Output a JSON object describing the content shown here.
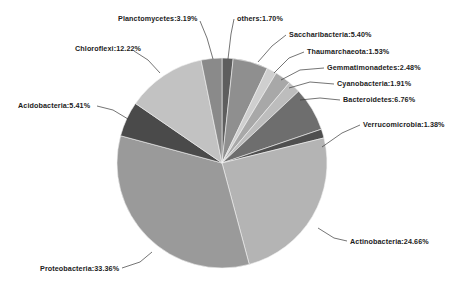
{
  "chart_data": {
    "type": "pie",
    "title": "",
    "subtitle": "",
    "xlabel": "",
    "ylabel": "",
    "legend_position": "none",
    "grid": false,
    "value_unit": "%",
    "start_angle_deg": 0,
    "direction": "clockwise",
    "categories": [
      "others",
      "Saccharibacteria",
      "Thaumarchaeota",
      "Gemmatimonadetes",
      "Cyanobacteria",
      "Bacteroidetes",
      "Verrucomicrobia",
      "Actinobacteria",
      "Proteobacteria",
      "Acidobacteria",
      "Chloroflexi",
      "Planctomycetes"
    ],
    "values": [
      1.7,
      5.4,
      1.53,
      2.48,
      1.91,
      6.76,
      1.38,
      24.66,
      33.36,
      5.41,
      12.22,
      3.19
    ],
    "colors": [
      "#5e5e5e",
      "#8f8f8f",
      "#cfcfcf",
      "#a8a8a8",
      "#bdbdbd",
      "#6e6e6e",
      "#4f4f4f",
      "#b4b4b4",
      "#9a9a9a",
      "#4a4a4a",
      "#c2c2c2",
      "#8a8a8a"
    ],
    "slices": [
      {
        "label": "others:1.70%",
        "name": "others",
        "value": 1.7,
        "color": "#5e5e5e"
      },
      {
        "label": "Saccharibacteria:5.40%",
        "name": "Saccharibacteria",
        "value": 5.4,
        "color": "#8f8f8f"
      },
      {
        "label": "Thaumarchaeota:1.53%",
        "name": "Thaumarchaeota",
        "value": 1.53,
        "color": "#cfcfcf"
      },
      {
        "label": "Gemmatimonadetes:2.48%",
        "name": "Gemmatimonadetes",
        "value": 2.48,
        "color": "#a8a8a8"
      },
      {
        "label": "Cyanobacteria:1.91%",
        "name": "Cyanobacteria",
        "value": 1.91,
        "color": "#bdbdbd"
      },
      {
        "label": "Bacteroidetes:6.76%",
        "name": "Bacteroidetes",
        "value": 6.76,
        "color": "#6e6e6e"
      },
      {
        "label": "Verrucomicrobia:1.38%",
        "name": "Verrucomicrobia",
        "value": 1.38,
        "color": "#4f4f4f"
      },
      {
        "label": "Actinobacteria:24.66%",
        "name": "Actinobacteria",
        "value": 24.66,
        "color": "#b4b4b4"
      },
      {
        "label": "Proteobacteria:33.36%",
        "name": "Proteobacteria",
        "value": 33.36,
        "color": "#9a9a9a"
      },
      {
        "label": "Acidobacteria:5.41%",
        "name": "Acidobacteria",
        "value": 5.41,
        "color": "#4a4a4a"
      },
      {
        "label": "Chloroflexi:12.22%",
        "name": "Chloroflexi",
        "value": 12.22,
        "color": "#c2c2c2"
      },
      {
        "label": "Planctomycetes:3.19%",
        "name": "Planctomycetes",
        "value": 3.19,
        "color": "#8a8a8a"
      }
    ]
  },
  "geometry": {
    "center_x": 222,
    "center_y": 163,
    "radius": 105
  },
  "labels": {
    "planctomycetes": {
      "text": "Planctomycetes:3.19%",
      "x": 118,
      "y": 14,
      "align": "left"
    },
    "others": {
      "text": "others:1.70%",
      "x": 237,
      "y": 14,
      "align": "left"
    },
    "saccharibacteria": {
      "text": "Saccharibacteria:5.40%",
      "x": 289,
      "y": 30,
      "align": "left"
    },
    "thaumarchaeota": {
      "text": "Thaumarchaeota:1.53%",
      "x": 307,
      "y": 47,
      "align": "left"
    },
    "gemmatimonadetes": {
      "text": "Gemmatimonadetes:2.48%",
      "x": 327,
      "y": 63,
      "align": "left"
    },
    "cyanobacteria": {
      "text": "Cyanobacteria:1.91%",
      "x": 337,
      "y": 79,
      "align": "left"
    },
    "bacteroidetes": {
      "text": "Bacteroidetes:6.76%",
      "x": 343,
      "y": 95,
      "align": "left"
    },
    "verrucomicrobia": {
      "text": "Verrucomicrobia:1.38%",
      "x": 363,
      "y": 120,
      "align": "left"
    },
    "actinobacteria": {
      "text": "Actinobacteria:24.66%",
      "x": 350,
      "y": 237,
      "align": "left"
    },
    "proteobacteria": {
      "text": "Proteobacteria:33.36%",
      "x": 40,
      "y": 264,
      "align": "left"
    },
    "acidobacteria": {
      "text": "Acidobacteria:5.41%",
      "x": 18,
      "y": 101,
      "align": "left"
    },
    "chloroflexi": {
      "text": "Chloroflexi:12.22%",
      "x": 75,
      "y": 44,
      "align": "left"
    }
  }
}
